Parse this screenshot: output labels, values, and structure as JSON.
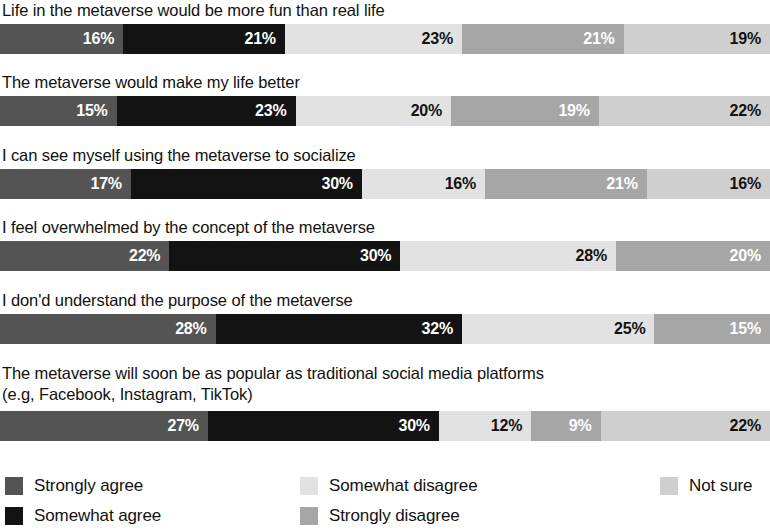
{
  "chart_data": {
    "type": "bar",
    "subtype": "100% stacked horizontal bar",
    "title": "",
    "xlabel": "",
    "ylabel": "",
    "xlim": [
      0,
      100
    ],
    "grid": false,
    "legend_position": "bottom",
    "value_suffix": "%",
    "categories": [
      "Life in the metaverse would be more fun than real life",
      "The metaverse would make my life better",
      "I can see myself using the metaverse to socialize",
      "I feel overwhelmed by the concept of the metaverse",
      "I don'd understand the purpose of the metaverse",
      "The metaverse will soon be as popular as traditional social media platforms\n(e.g, Facebook, Instagram, TikTok)"
    ],
    "series": [
      {
        "name": "Strongly agree",
        "color": "#545454",
        "text_color": "#ffffff",
        "values": [
          16,
          15,
          17,
          22,
          28,
          27
        ]
      },
      {
        "name": "Somewhat agree",
        "color": "#131313",
        "text_color": "#ffffff",
        "values": [
          21,
          23,
          30,
          30,
          32,
          30
        ]
      },
      {
        "name": "Somewhat disagree",
        "color": "#e2e2e2",
        "text_color": "#111111",
        "values": [
          23,
          20,
          16,
          28,
          25,
          12
        ]
      },
      {
        "name": "Strongly disagree",
        "color": "#a6a6a6",
        "text_color": "#ffffff",
        "values": [
          21,
          19,
          21,
          20,
          15,
          9
        ]
      },
      {
        "name": "Not sure",
        "color": "#cfcfcf",
        "text_color": "#111111",
        "values": [
          19,
          22,
          16,
          0,
          0,
          22
        ]
      }
    ]
  },
  "rows": [
    {
      "label": "Life in the metaverse would be more fun than real life",
      "segments": [
        {
          "series": "Strongly agree",
          "value": 16,
          "value_label": "16%",
          "color": "#545454",
          "text_color": "#ffffff"
        },
        {
          "series": "Somewhat agree",
          "value": 21,
          "value_label": "21%",
          "color": "#131313",
          "text_color": "#ffffff"
        },
        {
          "series": "Somewhat disagree",
          "value": 23,
          "value_label": "23%",
          "color": "#e2e2e2",
          "text_color": "#111111"
        },
        {
          "series": "Strongly disagree",
          "value": 21,
          "value_label": "21%",
          "color": "#a6a6a6",
          "text_color": "#ffffff"
        },
        {
          "series": "Not sure",
          "value": 19,
          "value_label": "19%",
          "color": "#cfcfcf",
          "text_color": "#111111"
        }
      ]
    },
    {
      "label": "The metaverse would make my life better",
      "segments": [
        {
          "series": "Strongly agree",
          "value": 15,
          "value_label": "15%",
          "color": "#545454",
          "text_color": "#ffffff"
        },
        {
          "series": "Somewhat agree",
          "value": 23,
          "value_label": "23%",
          "color": "#131313",
          "text_color": "#ffffff"
        },
        {
          "series": "Somewhat disagree",
          "value": 20,
          "value_label": "20%",
          "color": "#e2e2e2",
          "text_color": "#111111"
        },
        {
          "series": "Strongly disagree",
          "value": 19,
          "value_label": "19%",
          "color": "#a6a6a6",
          "text_color": "#ffffff"
        },
        {
          "series": "Not sure",
          "value": 22,
          "value_label": "22%",
          "color": "#cfcfcf",
          "text_color": "#111111"
        }
      ]
    },
    {
      "label": "I can see myself using the metaverse to socialize",
      "segments": [
        {
          "series": "Strongly agree",
          "value": 17,
          "value_label": "17%",
          "color": "#545454",
          "text_color": "#ffffff"
        },
        {
          "series": "Somewhat agree",
          "value": 30,
          "value_label": "30%",
          "color": "#131313",
          "text_color": "#ffffff"
        },
        {
          "series": "Somewhat disagree",
          "value": 16,
          "value_label": "16%",
          "color": "#e2e2e2",
          "text_color": "#111111"
        },
        {
          "series": "Strongly disagree",
          "value": 21,
          "value_label": "21%",
          "color": "#a6a6a6",
          "text_color": "#ffffff"
        },
        {
          "series": "Not sure",
          "value": 16,
          "value_label": "16%",
          "color": "#cfcfcf",
          "text_color": "#111111"
        }
      ]
    },
    {
      "label": "I feel overwhelmed by the concept of the metaverse",
      "segments": [
        {
          "series": "Strongly agree",
          "value": 22,
          "value_label": "22%",
          "color": "#545454",
          "text_color": "#ffffff"
        },
        {
          "series": "Somewhat agree",
          "value": 30,
          "value_label": "30%",
          "color": "#131313",
          "text_color": "#ffffff"
        },
        {
          "series": "Somewhat disagree",
          "value": 28,
          "value_label": "28%",
          "color": "#e2e2e2",
          "text_color": "#111111"
        },
        {
          "series": "Strongly disagree",
          "value": 20,
          "value_label": "20%",
          "color": "#a6a6a6",
          "text_color": "#ffffff"
        }
      ]
    },
    {
      "label": "I don'd understand the purpose of the metaverse",
      "segments": [
        {
          "series": "Strongly agree",
          "value": 28,
          "value_label": "28%",
          "color": "#545454",
          "text_color": "#ffffff"
        },
        {
          "series": "Somewhat agree",
          "value": 32,
          "value_label": "32%",
          "color": "#131313",
          "text_color": "#ffffff"
        },
        {
          "series": "Somewhat disagree",
          "value": 25,
          "value_label": "25%",
          "color": "#e2e2e2",
          "text_color": "#111111"
        },
        {
          "series": "Strongly disagree",
          "value": 15,
          "value_label": "15%",
          "color": "#a6a6a6",
          "text_color": "#ffffff"
        }
      ]
    },
    {
      "label": "The metaverse will soon be as popular as traditional social media platforms\n(e.g, Facebook, Instagram, TikTok)",
      "segments": [
        {
          "series": "Strongly agree",
          "value": 27,
          "value_label": "27%",
          "color": "#545454",
          "text_color": "#ffffff"
        },
        {
          "series": "Somewhat agree",
          "value": 30,
          "value_label": "30%",
          "color": "#131313",
          "text_color": "#ffffff"
        },
        {
          "series": "Somewhat disagree",
          "value": 12,
          "value_label": "12%",
          "color": "#e2e2e2",
          "text_color": "#111111"
        },
        {
          "series": "Strongly disagree",
          "value": 9,
          "value_label": "9%",
          "color": "#a6a6a6",
          "text_color": "#ffffff"
        },
        {
          "series": "Not sure",
          "value": 22,
          "value_label": "22%",
          "color": "#cfcfcf",
          "text_color": "#111111"
        }
      ]
    }
  ],
  "legend": {
    "items": [
      {
        "label": "Strongly agree",
        "color": "#545454",
        "col": 0,
        "row": 0
      },
      {
        "label": "Somewhat agree",
        "color": "#131313",
        "col": 0,
        "row": 1
      },
      {
        "label": "Somewhat disagree",
        "color": "#e2e2e2",
        "col": 1,
        "row": 0
      },
      {
        "label": "Strongly disagree",
        "color": "#a6a6a6",
        "col": 1,
        "row": 1
      },
      {
        "label": "Not sure",
        "color": "#cfcfcf",
        "col": 2,
        "row": 0
      }
    ]
  }
}
